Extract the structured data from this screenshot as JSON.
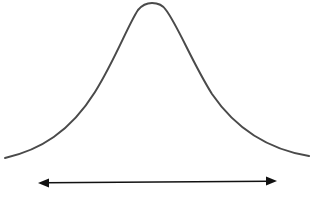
{
  "diagram": {
    "type": "bell-curve",
    "curve": {
      "stroke": "#4a4a4a",
      "stroke_width": 2,
      "start": [
        5,
        158
      ],
      "peak": [
        152,
        3
      ],
      "end": [
        309,
        156
      ]
    },
    "range_arrow": {
      "stroke": "#111111",
      "direction": "double-headed",
      "start": [
        39,
        183
      ],
      "end": [
        276,
        181
      ]
    },
    "caption": {
      "text": "",
      "note_visible": "clipped at bottom edge, illegible"
    }
  }
}
